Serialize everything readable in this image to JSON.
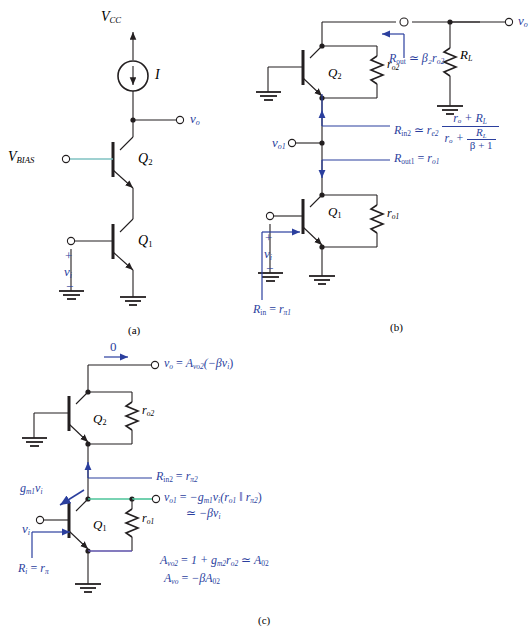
{
  "figure": {
    "panels": [
      "(a)",
      "(b)",
      "(c)"
    ],
    "colors": {
      "wire": "#231f20",
      "annotation": "#2b3f9e",
      "highlight_teal": "#7fc2c2",
      "highlight_green": "#4dc49a",
      "highlight_purple": "#5b4fa8",
      "background": "#ffffff"
    }
  },
  "panel_a": {
    "caption": "(a)",
    "supply_label": "V",
    "supply_sub": "CC",
    "current_source_label": "I",
    "bias_label": "V",
    "bias_sub": "BIAS",
    "transistor_top": "Q",
    "transistor_top_sub": "2",
    "transistor_bottom": "Q",
    "transistor_bottom_sub": "1",
    "output_node": "v",
    "output_node_sub": "o",
    "input_node": "v",
    "input_node_sub": "i",
    "plus_sign": "+",
    "minus_sign": "−"
  },
  "panel_b": {
    "caption": "(b)",
    "transistor_top": "Q",
    "transistor_top_sub": "2",
    "transistor_bottom": "Q",
    "transistor_bottom_sub": "1",
    "r_o2_label": "r",
    "r_o2_sub": "o2",
    "r_o1_label": "r",
    "r_o1_sub": "o1",
    "rl_label": "R",
    "rl_sub": "L",
    "output_node": "v",
    "output_node_sub": "o",
    "mid_node": "v",
    "mid_node_sub": "o1",
    "input_node": "v",
    "input_node_sub": "i",
    "plus_sign": "+",
    "minus_sign": "−",
    "eq_rout": {
      "lhs": "R",
      "lhs_sub": "out",
      "rel": "≃",
      "rhs": "β₂r",
      "rhs_sub": "o2"
    },
    "eq_rin2": {
      "lhs": "R",
      "lhs_sub": "in2",
      "rel": "≃",
      "factor": "r",
      "factor_sub": "e2",
      "num": "rₒ + R",
      "num_sub": "L",
      "den_left": "rₒ +",
      "den_frac_num": "R",
      "den_frac_num_sub": "L",
      "den_frac_den": "β + 1"
    },
    "eq_rout1": {
      "lhs": "R",
      "lhs_sub": "out1",
      "rel": "=",
      "rhs": "r",
      "rhs_sub": "o1"
    },
    "eq_rin": {
      "lhs": "R",
      "lhs_sub": "in",
      "rel": "=",
      "rhs": "r",
      "rhs_sub": "π1"
    }
  },
  "panel_c": {
    "caption": "(c)",
    "zero_label": "0",
    "transistor_top": "Q",
    "transistor_top_sub": "2",
    "transistor_bottom": "Q",
    "transistor_bottom_sub": "1",
    "r_o2_label": "r",
    "r_o2_sub": "o2",
    "r_o1_label": "r",
    "r_o1_sub": "o1",
    "input_node": "v",
    "input_node_sub": "i",
    "gm_label": "g",
    "gm_sub": "m1",
    "gm_tail": "v",
    "gm_tail_sub": "i",
    "eq_vo": {
      "lhs": "v",
      "lhs_sub": "o",
      "rel": "=",
      "rhs": "A",
      "rhs_sub": "vo2",
      "tail": "(−βv",
      "tail_sub": "i",
      "tail_end": ")"
    },
    "eq_rin2": {
      "lhs": "R",
      "lhs_sub": "in2",
      "rel": "=",
      "rhs": "r",
      "rhs_sub": "π2"
    },
    "eq_vo1_line1": {
      "lhs": "v",
      "lhs_sub": "o1",
      "rel": "=",
      "rhs": "−g",
      "rhs_sub": "m1",
      "v": "v",
      "v_sub": "i",
      "paren_open": "(r",
      "paren_open_sub": "o1",
      "par": " ‖ r",
      "par_sub": "π2",
      "paren_close": ")"
    },
    "eq_vo1_line2": {
      "rel": "≃",
      "rhs": "−βv",
      "rhs_sub": "i"
    },
    "eq_ri": {
      "lhs": "R",
      "lhs_sub": "i",
      "rel": "=",
      "rhs": "r",
      "rhs_sub": "π"
    },
    "eq_avo2": {
      "lhs": "A",
      "lhs_sub": "vo2",
      "rel": "=",
      "mid": "1 + g",
      "mid_sub": "m2",
      "r": "r",
      "r_sub": "o2",
      "rel2": "≃",
      "rhs": "A",
      "rhs_sub": "02"
    },
    "eq_avo": {
      "lhs": "A",
      "lhs_sub": "vo",
      "rel": "=",
      "rhs": "−βA",
      "rhs_sub": "02"
    }
  }
}
